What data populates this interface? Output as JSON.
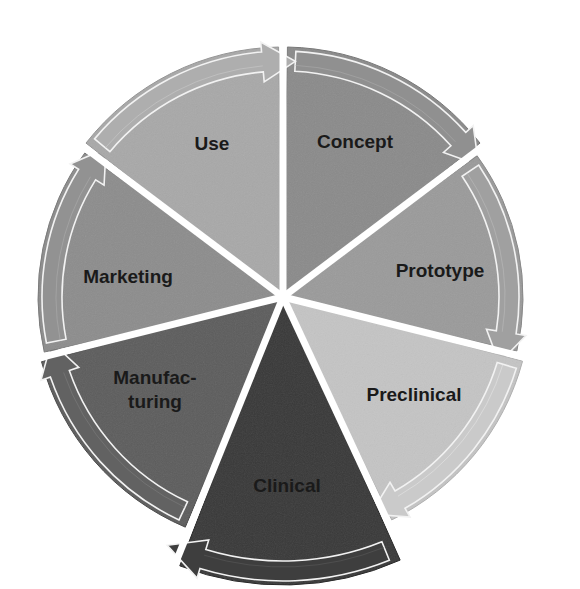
{
  "diagram": {
    "type": "cycle",
    "direction": "clockwise",
    "center": [
      283,
      297
    ],
    "segments": [
      {
        "id": "concept",
        "label": "Concept",
        "lines": [
          "Concept"
        ],
        "color": "#8a8a8a",
        "start": 1,
        "end": 52,
        "r": 250,
        "label_pos": [
          355,
          148
        ]
      },
      {
        "id": "prototype",
        "label": "Prototype",
        "lines": [
          "Prototype"
        ],
        "color": "#9a9a9a",
        "start": 54,
        "end": 103,
        "r": 240,
        "label_pos": [
          440,
          277
        ]
      },
      {
        "id": "preclinical",
        "label": "Preclinical",
        "lines": [
          "Preclinical"
        ],
        "color": "#c4c4c4",
        "start": 105,
        "end": 154,
        "r": 248,
        "label_pos": [
          414,
          401
        ]
      },
      {
        "id": "clinical",
        "label": "Clinical",
        "lines": [
          "Clinical"
        ],
        "color": "#383838",
        "start": 156,
        "end": 201,
        "r": 288,
        "label_pos": [
          287,
          492
        ]
      },
      {
        "id": "manufacturing",
        "label": "Manufac-turing",
        "lines": [
          "Manufac-",
          "turing"
        ],
        "color": "#5c5c5c",
        "start": 203,
        "end": 255,
        "r": 250,
        "label_pos": [
          155,
          384
        ]
      },
      {
        "id": "marketing",
        "label": "Marketing",
        "lines": [
          "Marketing"
        ],
        "color": "#8c8c8c",
        "start": 257,
        "end": 306,
        "r": 245,
        "label_pos": [
          128,
          283
        ]
      },
      {
        "id": "use",
        "label": "Use",
        "lines": [
          "Use"
        ],
        "color": "#a8a8a8",
        "start": 308,
        "end": 359,
        "r": 250,
        "label_pos": [
          212,
          150
        ]
      }
    ]
  }
}
